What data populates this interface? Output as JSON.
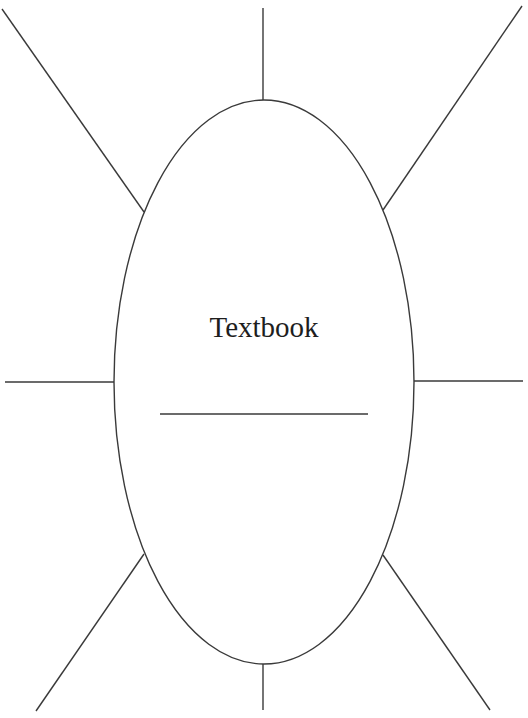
{
  "diagram": {
    "type": "concept-web",
    "center_label": "Textbook",
    "colors": {
      "stroke": "#3a3a3a",
      "text": "#1e1e1e",
      "background": "#ffffff"
    },
    "ellipse": {
      "cx": 264,
      "cy": 382,
      "rx": 150,
      "ry": 282
    },
    "blank_line": {
      "x1": 160,
      "y1": 414,
      "x2": 368,
      "y2": 414
    },
    "spokes": [
      {
        "name": "top",
        "x1": 263,
        "y1": 8,
        "x2": 263,
        "y2": 100
      },
      {
        "name": "top-right",
        "x1": 522,
        "y1": 6,
        "x2": 383,
        "y2": 210
      },
      {
        "name": "right",
        "x1": 414,
        "y1": 381,
        "x2": 523,
        "y2": 381
      },
      {
        "name": "bottom-right",
        "x1": 383,
        "y1": 555,
        "x2": 490,
        "y2": 710
      },
      {
        "name": "bottom",
        "x1": 263,
        "y1": 664,
        "x2": 263,
        "y2": 710
      },
      {
        "name": "bottom-left",
        "x1": 144,
        "y1": 554,
        "x2": 36,
        "y2": 711
      },
      {
        "name": "left",
        "x1": 5,
        "y1": 382,
        "x2": 114,
        "y2": 382
      },
      {
        "name": "top-left",
        "x1": 2,
        "y1": 9,
        "x2": 144,
        "y2": 212
      }
    ]
  }
}
